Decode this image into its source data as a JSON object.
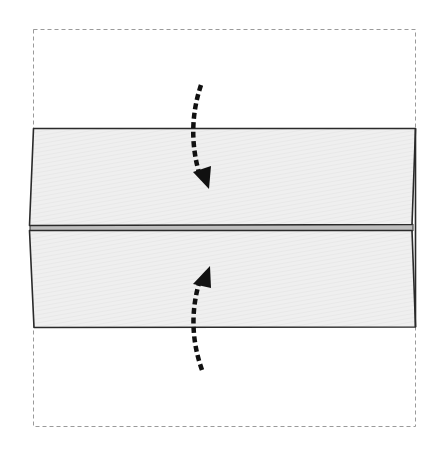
{
  "diagram": {
    "colors": {
      "background": "#ffffff",
      "outline_dashed": "#9a9a9a",
      "panel_fill": "#efefef",
      "panel_stroke": "#2a2a2a",
      "gap_fill": "#bdbdbd",
      "arrow": "#111111"
    },
    "elements": {
      "original_sheet": {
        "style": "dashed",
        "label": "original-square-outline"
      },
      "top_flap": {
        "label": "top-folded-flap"
      },
      "bottom_flap": {
        "label": "bottom-folded-flap"
      },
      "arrow_top": {
        "direction": "down",
        "style": "dashed-curved"
      },
      "arrow_bottom": {
        "direction": "up",
        "style": "dashed-curved"
      }
    }
  }
}
